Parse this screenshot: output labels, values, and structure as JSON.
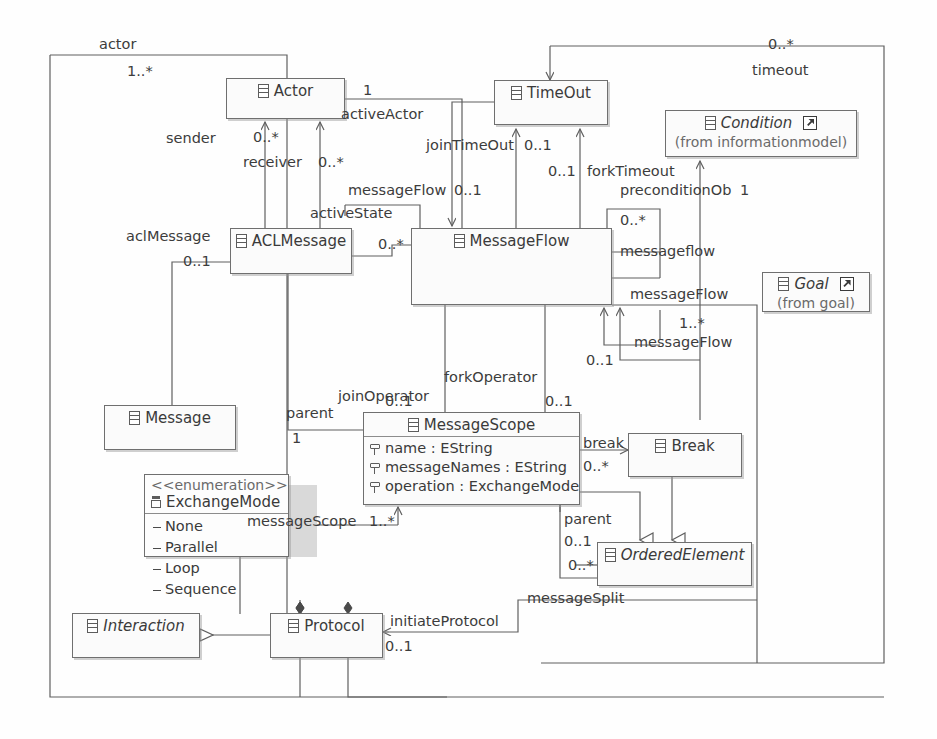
{
  "diagram": {
    "kind": "uml-class-diagram",
    "title": "",
    "line_color": "#6f6f6f",
    "box_fill": "#fbfbfb",
    "text_color": "#3a3a3a",
    "shadow_color": "#b6b6b6"
  },
  "classes": [
    {
      "id": "actor",
      "name": "Actor",
      "italic": false,
      "stereotype": "",
      "from": "",
      "external": false,
      "attributes": [],
      "literals": []
    },
    {
      "id": "timeout",
      "name": "TimeOut",
      "italic": false,
      "stereotype": "",
      "from": "",
      "external": false,
      "attributes": [],
      "literals": []
    },
    {
      "id": "condition",
      "name": "Condition",
      "italic": true,
      "stereotype": "",
      "from": "(from informationmodel)",
      "external": true,
      "attributes": [],
      "literals": []
    },
    {
      "id": "aclmessage",
      "name": "ACLMessage",
      "italic": false,
      "stereotype": "",
      "from": "",
      "external": false,
      "attributes": [],
      "literals": []
    },
    {
      "id": "messageflow",
      "name": "MessageFlow",
      "italic": false,
      "stereotype": "",
      "from": "",
      "external": false,
      "attributes": [],
      "literals": []
    },
    {
      "id": "goal",
      "name": "Goal",
      "italic": true,
      "stereotype": "",
      "from": "(from goal)",
      "external": true,
      "attributes": [],
      "literals": []
    },
    {
      "id": "message",
      "name": "Message",
      "italic": false,
      "stereotype": "",
      "from": "",
      "external": false,
      "attributes": [],
      "literals": []
    },
    {
      "id": "messagescope",
      "name": "MessageScope",
      "italic": false,
      "stereotype": "",
      "from": "",
      "external": false,
      "attributes": [
        "name : EString",
        "messageNames : EString",
        "operation : ExchangeMode"
      ],
      "literals": []
    },
    {
      "id": "break",
      "name": "Break",
      "italic": false,
      "stereotype": "",
      "from": "",
      "external": false,
      "attributes": [],
      "literals": []
    },
    {
      "id": "exchangemode",
      "name": "ExchangeMode",
      "italic": false,
      "stereotype": "<<enumeration>>",
      "from": "",
      "external": false,
      "attributes": [],
      "literals": [
        "None",
        "Parallel",
        "Loop",
        "Sequence"
      ]
    },
    {
      "id": "orderedelement",
      "name": "OrderedElement",
      "italic": true,
      "stereotype": "",
      "from": "",
      "external": false,
      "attributes": [],
      "literals": []
    },
    {
      "id": "interaction",
      "name": "Interaction",
      "italic": true,
      "stereotype": "",
      "from": "",
      "external": false,
      "attributes": [],
      "literals": []
    },
    {
      "id": "protocol",
      "name": "Protocol",
      "italic": false,
      "stereotype": "",
      "from": "",
      "external": false,
      "attributes": [],
      "literals": []
    }
  ],
  "edge_labels": [
    {
      "id": "l-actor",
      "text": "actor"
    },
    {
      "id": "l-actor-mult",
      "text": "1..*"
    },
    {
      "id": "l-timeout-mult",
      "text": "0..*"
    },
    {
      "id": "l-timeout",
      "text": "timeout"
    },
    {
      "id": "l-activeactor-mult",
      "text": "1"
    },
    {
      "id": "l-activeactor",
      "text": "activeActor"
    },
    {
      "id": "l-sender",
      "text": "sender"
    },
    {
      "id": "l-sender-mult",
      "text": "0..*"
    },
    {
      "id": "l-receiver",
      "text": "receiver"
    },
    {
      "id": "l-receiver-mult",
      "text": "0..*"
    },
    {
      "id": "l-jointimeout",
      "text": "joinTimeOut"
    },
    {
      "id": "l-jointimeout-mult",
      "text": "0..1"
    },
    {
      "id": "l-forktimeout-mult",
      "text": "0..1"
    },
    {
      "id": "l-forktimeout",
      "text": "forkTimeout"
    },
    {
      "id": "l-messageflow-a",
      "text": "messageFlow"
    },
    {
      "id": "l-messageflow-a-mult",
      "text": "0..1"
    },
    {
      "id": "l-activestate",
      "text": "activeState"
    },
    {
      "id": "l-preconditionobj",
      "text": "preconditionOb"
    },
    {
      "id": "l-preconditionobj-mult",
      "text": "1"
    },
    {
      "id": "l-aclmessage",
      "text": "aclMessage"
    },
    {
      "id": "l-aclmessage-mult",
      "text": "0..1"
    },
    {
      "id": "l-msgflow-left-mult",
      "text": "0..*"
    },
    {
      "id": "l-messageflow-b-mult",
      "text": "0..*"
    },
    {
      "id": "l-messageflow-b",
      "text": "messageflow"
    },
    {
      "id": "l-messageflow-c",
      "text": "messageFlow"
    },
    {
      "id": "l-messageflow-d-mult",
      "text": "1..*"
    },
    {
      "id": "l-messageflow-d",
      "text": "messageFlow"
    },
    {
      "id": "l-messageflow-e-mult",
      "text": "0..1"
    },
    {
      "id": "l-forkoperator",
      "text": "forkOperator"
    },
    {
      "id": "l-forkoperator-mult",
      "text": "0..1"
    },
    {
      "id": "l-joinoperator",
      "text": "joinOperator"
    },
    {
      "id": "l-joinoperator-mult",
      "text": "0..1"
    },
    {
      "id": "l-parent",
      "text": "parent"
    },
    {
      "id": "l-parent-mult",
      "text": "1"
    },
    {
      "id": "l-break",
      "text": "break"
    },
    {
      "id": "l-break-mult",
      "text": "0..*"
    },
    {
      "id": "l-messagescope",
      "text": "messageScope"
    },
    {
      "id": "l-messagescope-mult",
      "text": "1..*"
    },
    {
      "id": "l-parent2",
      "text": "parent"
    },
    {
      "id": "l-parent2-mult",
      "text": "0..1"
    },
    {
      "id": "l-ordered-mult",
      "text": "0..*"
    },
    {
      "id": "l-messagesplit",
      "text": "messageSplit"
    },
    {
      "id": "l-initiateprotocol",
      "text": "initiateProtocol"
    },
    {
      "id": "l-initiateprotocol-mult",
      "text": "0..1"
    }
  ]
}
